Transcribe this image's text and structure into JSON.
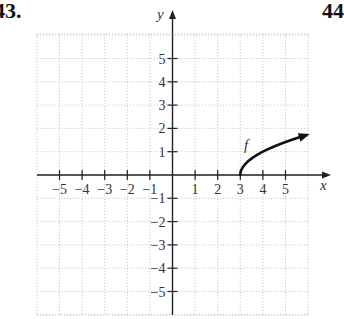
{
  "problem": {
    "number": "43.",
    "next_number": "44"
  },
  "colors": {
    "axis": "#222222",
    "grid": "#bbbbbb",
    "curve": "#111111",
    "text": "#333333"
  },
  "chart_data": {
    "type": "line",
    "title": "",
    "xlabel": "x",
    "ylabel": "y",
    "xlim": [
      -6,
      6.5
    ],
    "ylim": [
      -6,
      6.5
    ],
    "grid": true,
    "x_ticks": [
      -5,
      -4,
      -3,
      -2,
      -1,
      1,
      2,
      3,
      4,
      5
    ],
    "y_ticks": [
      -5,
      -4,
      -3,
      -2,
      -1,
      1,
      2,
      3,
      4,
      5
    ],
    "x_tick_labels": [
      "−5",
      "−4",
      "−3",
      "−2",
      "−1",
      "1",
      "2",
      "3",
      "4",
      "5"
    ],
    "y_tick_labels": [
      "5",
      "4",
      "3",
      "2",
      "1",
      "−1",
      "−2",
      "−3",
      "−4",
      "−5"
    ],
    "series": [
      {
        "name": "f",
        "description": "square-root shaped curve starting at (3,0), increasing, arrow at right end",
        "x": [
          3,
          3.25,
          4,
          5,
          6
        ],
        "y": [
          0,
          0.5,
          1,
          1.41,
          1.73
        ],
        "start_point": [
          3,
          0
        ],
        "end_arrow": true
      }
    ],
    "annotations": [
      {
        "text": "f",
        "x": 3.3,
        "y": 1.3
      }
    ]
  }
}
